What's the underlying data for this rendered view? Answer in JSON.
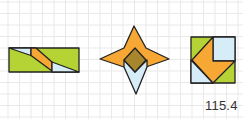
{
  "figure": {
    "label": "115.4",
    "grid": {
      "cell_size": 11.5,
      "origin_x": 8,
      "origin_y": 2,
      "color": "#e9e9e9"
    },
    "colors": {
      "green": "#b5d334",
      "orange": "#f7a734",
      "light_blue": "#d6ecf6",
      "olive": "#a8862e",
      "outline": "#222222"
    },
    "shapes": [
      {
        "name": "rectangle-dissection",
        "pieces": [
          {
            "name": "green-base",
            "color": "green",
            "points": "9,48 79,48 79,72 9,72"
          },
          {
            "name": "blue-triangle-left",
            "color": "light_blue",
            "points": "9,48 31,48 31,55.5"
          },
          {
            "name": "orange-parallelogram",
            "color": "orange",
            "points": "31,48 36,48 52,62 52,71 31,55.5"
          },
          {
            "name": "blue-triangle-right",
            "color": "light_blue",
            "points": "52,62 79,72 52,72"
          }
        ]
      },
      {
        "name": "star-dissection",
        "pieces": [
          {
            "name": "orange-star",
            "color": "orange",
            "points": "134,26 146,48 169,59 146,67 134,72 124,67 100,59 124,48"
          },
          {
            "name": "blue-kite",
            "color": "light_blue",
            "points": "124,60 135,72 147,60 147,67 136,94 124,67"
          },
          {
            "name": "olive-diamond",
            "color": "olive",
            "points": "135,48 146,60 135,72 124,60"
          }
        ]
      },
      {
        "name": "square-dissection",
        "pieces": [
          {
            "name": "green-base",
            "color": "green",
            "points": "191,37 235,37 235,83 191,83"
          },
          {
            "name": "blue-top-right",
            "color": "light_blue",
            "points": "213,37 235,37 235,61 213,61"
          },
          {
            "name": "blue-bottom-left",
            "color": "light_blue",
            "points": "191,60 213,83 191,83"
          },
          {
            "name": "orange-chevron",
            "color": "orange",
            "points": "213,37 213,61 235,61 213,83 192,60"
          }
        ]
      }
    ]
  }
}
